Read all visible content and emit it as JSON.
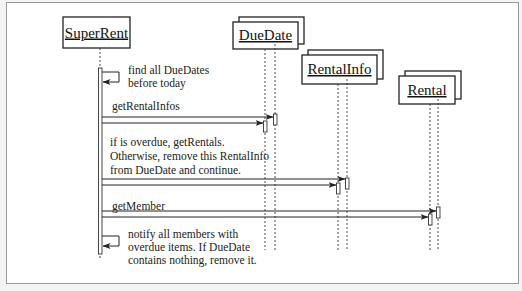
{
  "diagram": {
    "type": "UML sequence diagram",
    "objects": [
      {
        "id": "superrent",
        "name": "SuperRent",
        "multi": false
      },
      {
        "id": "duedate",
        "name": "DueDate",
        "multi": true
      },
      {
        "id": "rentalinfo",
        "name": "RentalInfo",
        "multi": true
      },
      {
        "id": "rental",
        "name": "Rental",
        "multi": true
      }
    ],
    "messages": [
      {
        "from": "SuperRent",
        "to": "SuperRent",
        "kind": "self",
        "label_lines": [
          "find all DueDates",
          "before today"
        ]
      },
      {
        "from": "SuperRent",
        "to": "DueDate",
        "kind": "call",
        "label": "getRentalInfos"
      },
      {
        "from": "SuperRent",
        "to": "RentalInfo",
        "kind": "call",
        "label_lines": [
          "if is overdue, getRentals.",
          "Otherwise, remove this RentalInfo",
          "from DueDate and continue."
        ]
      },
      {
        "from": "SuperRent",
        "to": "Rental",
        "kind": "call",
        "label": "getMember"
      },
      {
        "from": "SuperRent",
        "to": "SuperRent",
        "kind": "self",
        "label_lines": [
          "notify all members with",
          "overdue items. If DueDate",
          "contains nothing, remove it."
        ]
      }
    ]
  },
  "labels": {
    "superrent": "SuperRent",
    "duedate": "DueDate",
    "rentalinfo": "RentalInfo",
    "rental": "Rental",
    "msg1_l1": "find all DueDates",
    "msg1_l2": "before today",
    "msg2": "getRentalInfos",
    "msg3_l1": "if is overdue, getRentals.",
    "msg3_l2": "Otherwise, remove this RentalInfo",
    "msg3_l3": "from DueDate and continue.",
    "msg4": "getMember",
    "msg5_l1": "notify all members with",
    "msg5_l2": "overdue items. If DueDate",
    "msg5_l3": "contains nothing, remove it."
  },
  "colors": {
    "line": "#222222",
    "frame_border": "#9a9a9a",
    "background": "#ffffff"
  }
}
